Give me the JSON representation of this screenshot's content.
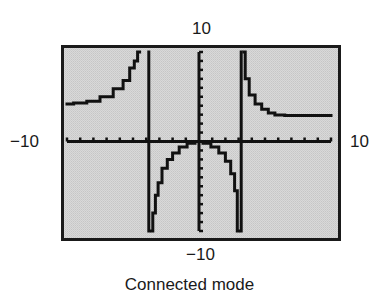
{
  "figure": {
    "caption": "Connected mode",
    "window_labels": {
      "ymax": "10",
      "ymin": "−10",
      "xmin": "−10",
      "xmax": "10"
    }
  },
  "colors": {
    "screen_background": "#d4d4d4",
    "frame": "#1a1a1a",
    "plot_ink": "#111111"
  },
  "chart_data": {
    "type": "line",
    "title": "",
    "caption": "Connected mode",
    "xlabel": "",
    "ylabel": "",
    "xlim": [
      -10,
      10
    ],
    "ylim": [
      -10,
      10
    ],
    "xscl": 1,
    "yscl": 1,
    "grid": false,
    "axes": true,
    "tick_labels": {
      "x_min": "−10",
      "x_max": "10",
      "y_min": "−10",
      "y_max": "10"
    },
    "mode": "connected",
    "series": [
      {
        "name": "left branch",
        "x": [
          -10,
          -9,
          -8,
          -7,
          -6,
          -5.5,
          -5,
          -4.8,
          -4.5
        ],
        "y": [
          4.2,
          4.3,
          4.5,
          5.0,
          5.9,
          6.8,
          8.2,
          9.0,
          10
        ]
      },
      {
        "name": "connected-mode spurious vertical line (left)",
        "x": [
          -3.8,
          -3.8
        ],
        "y": [
          10,
          -10
        ]
      },
      {
        "name": "middle branch",
        "x": [
          -3.6,
          -3.4,
          -3.2,
          -3.0,
          -2.6,
          -2.2,
          -1.8,
          -1.2,
          -0.6,
          0,
          0.6,
          1.2,
          1.8,
          2.2,
          2.6,
          2.8,
          3.0
        ],
        "y": [
          -10,
          -8.0,
          -6.0,
          -4.6,
          -3.0,
          -2.0,
          -1.3,
          -0.6,
          -0.2,
          0,
          -0.2,
          -0.6,
          -1.3,
          -2.2,
          -3.6,
          -5.5,
          -10
        ]
      },
      {
        "name": "connected-mode spurious vertical line (right)",
        "x": [
          3.2,
          3.2
        ],
        "y": [
          -10,
          10
        ]
      },
      {
        "name": "right branch",
        "x": [
          3.4,
          3.6,
          4.0,
          4.5,
          5.0,
          5.5,
          6.0,
          7.0,
          8.0,
          9.0,
          10
        ],
        "y": [
          10,
          7.0,
          5.2,
          4.2,
          3.6,
          3.2,
          2.95,
          2.9,
          2.9,
          2.9,
          2.9
        ]
      }
    ]
  }
}
